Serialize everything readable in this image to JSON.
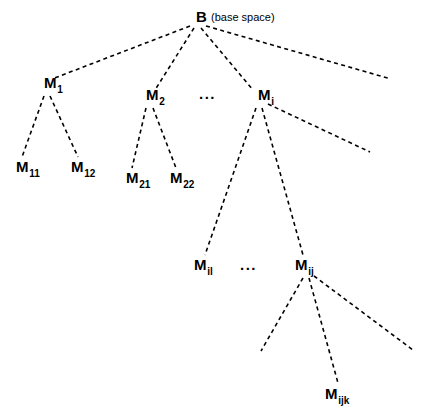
{
  "diagram": {
    "type": "tree",
    "edge_style": "dashed",
    "edge_color": "#000000",
    "background_color": "#ffffff",
    "text_color": "#000000",
    "canvas": {
      "width": 423,
      "height": 416
    },
    "root_annotation": "(base space)",
    "nodes": [
      {
        "id": "B",
        "base": "B",
        "sub": "",
        "x": 196,
        "y": 22,
        "level": 0
      },
      {
        "id": "M1",
        "base": "M",
        "sub": "1",
        "x": 44,
        "y": 88,
        "level": 1
      },
      {
        "id": "M2",
        "base": "M",
        "sub": "2",
        "x": 146,
        "y": 100,
        "level": 1
      },
      {
        "id": "Mi",
        "base": "M",
        "sub": "i",
        "x": 258,
        "y": 100,
        "level": 1
      },
      {
        "id": "M11",
        "base": "M",
        "sub": "11",
        "x": 16,
        "y": 172,
        "level": 2
      },
      {
        "id": "M12",
        "base": "M",
        "sub": "12",
        "x": 71,
        "y": 172,
        "level": 2
      },
      {
        "id": "M21",
        "base": "M",
        "sub": "21",
        "x": 126,
        "y": 183,
        "level": 2
      },
      {
        "id": "M22",
        "base": "M",
        "sub": "22",
        "x": 170,
        "y": 183,
        "level": 2
      },
      {
        "id": "Mil",
        "base": "M",
        "sub": "il",
        "x": 194,
        "y": 270,
        "level": 2
      },
      {
        "id": "Mij",
        "base": "M",
        "sub": "ij",
        "x": 295,
        "y": 270,
        "level": 2
      },
      {
        "id": "Mijk",
        "base": "M",
        "sub": "ijk",
        "x": 325,
        "y": 399,
        "level": 3
      }
    ],
    "ellipses": [
      {
        "id": "ellipsis-level-1",
        "text": "...",
        "x": 199,
        "y": 99
      },
      {
        "id": "ellipsis-level-2",
        "text": "...",
        "x": 240,
        "y": 270
      }
    ],
    "edges": [
      {
        "id": "B-M1",
        "from": "B",
        "to": "M1",
        "x1": 190,
        "y1": 26,
        "x2": 52,
        "y2": 79
      },
      {
        "id": "B-M2",
        "from": "B",
        "to": "M2",
        "x1": 194,
        "y1": 28,
        "x2": 155,
        "y2": 90
      },
      {
        "id": "B-Mi",
        "from": "B",
        "to": "Mi",
        "x1": 201,
        "y1": 28,
        "x2": 253,
        "y2": 90
      },
      {
        "id": "B-right",
        "from": "B",
        "to": "",
        "x1": 206,
        "y1": 26,
        "x2": 391,
        "y2": 79
      },
      {
        "id": "M1-M11",
        "from": "M1",
        "to": "M11",
        "x1": 44,
        "y1": 96,
        "x2": 22,
        "y2": 157
      },
      {
        "id": "M1-M12",
        "from": "M1",
        "to": "M12",
        "x1": 50,
        "y1": 96,
        "x2": 78,
        "y2": 157
      },
      {
        "id": "M2-M21",
        "from": "M2",
        "to": "M21",
        "x1": 146,
        "y1": 108,
        "x2": 132,
        "y2": 168
      },
      {
        "id": "M2-M22",
        "from": "M2",
        "to": "M22",
        "x1": 153,
        "y1": 108,
        "x2": 176,
        "y2": 168
      },
      {
        "id": "Mi-Mil",
        "from": "Mi",
        "to": "Mil",
        "x1": 256,
        "y1": 108,
        "x2": 205,
        "y2": 255
      },
      {
        "id": "Mi-Mij",
        "from": "Mi",
        "to": "Mij",
        "x1": 262,
        "y1": 108,
        "x2": 303,
        "y2": 255
      },
      {
        "id": "Mi-right",
        "from": "Mi",
        "to": "",
        "x1": 268,
        "y1": 104,
        "x2": 370,
        "y2": 152
      },
      {
        "id": "Mij-left",
        "from": "Mij",
        "to": "",
        "x1": 303,
        "y1": 278,
        "x2": 261,
        "y2": 351
      },
      {
        "id": "Mij-Mijk",
        "from": "Mij",
        "to": "Mijk",
        "x1": 309,
        "y1": 278,
        "x2": 338,
        "y2": 383
      },
      {
        "id": "Mij-right",
        "from": "Mij",
        "to": "",
        "x1": 314,
        "y1": 276,
        "x2": 413,
        "y2": 350
      }
    ]
  }
}
